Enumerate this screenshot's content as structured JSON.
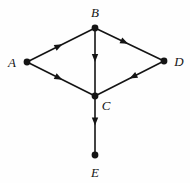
{
  "figure": {
    "background_color": "#fefefe",
    "stroke_color": "#141414",
    "width": 190,
    "height": 183
  },
  "graph": {
    "type": "directed-graph",
    "vertices": [
      {
        "id": "A",
        "label": "A",
        "x": 27,
        "y": 62,
        "label_x": 12,
        "label_y": 62,
        "radius": 3.4
      },
      {
        "id": "B",
        "label": "B",
        "x": 95,
        "y": 28,
        "label_x": 95,
        "label_y": 12,
        "radius": 3.4
      },
      {
        "id": "C",
        "label": "C",
        "x": 95,
        "y": 96,
        "label_x": 106,
        "label_y": 105,
        "radius": 3.4
      },
      {
        "id": "D",
        "label": "D",
        "x": 164,
        "y": 61,
        "label_x": 179,
        "label_y": 61,
        "radius": 3.4
      },
      {
        "id": "E",
        "label": "E",
        "x": 95,
        "y": 155,
        "label_x": 95,
        "label_y": 172,
        "radius": 3.4
      }
    ],
    "edges": [
      {
        "id": "A-B",
        "from": "A",
        "to": "B",
        "directed": true,
        "arrow_at": 0.52
      },
      {
        "id": "B-D",
        "from": "B",
        "to": "D",
        "directed": true,
        "arrow_at": 0.48
      },
      {
        "id": "A-C",
        "from": "A",
        "to": "C",
        "directed": true,
        "arrow_at": 0.52
      },
      {
        "id": "D-C",
        "from": "D",
        "to": "C",
        "directed": true,
        "arrow_at": 0.5
      },
      {
        "id": "B-C",
        "from": "B",
        "to": "C",
        "directed": true,
        "arrow_at": 0.5
      },
      {
        "id": "C-E",
        "from": "C",
        "to": "E",
        "directed": true,
        "arrow_at": 0.5
      }
    ],
    "edge_list_text": [
      "A→B",
      "B→D",
      "A→C",
      "D→C",
      "B→C",
      "C→E"
    ],
    "line_width": 1.6,
    "arrow_length": 8,
    "arrow_half_width": 3.2
  }
}
